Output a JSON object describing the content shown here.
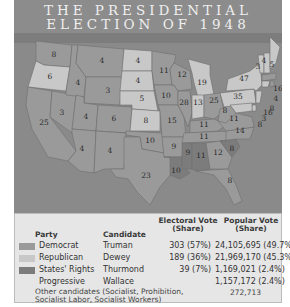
{
  "title": {
    "line1": "THE PRESIDENTIAL",
    "line2": "ELECTION OF 1948"
  },
  "colors": {
    "democrat": "#9a9a9a",
    "republican": "#c8c8c8",
    "states_rights": "#7c7c7c",
    "ocean": "#8a8a8a",
    "legend_bg": "#e6e6e6"
  },
  "map": {
    "states": [
      {
        "abbr": "WA",
        "ev": "8",
        "party": "democrat"
      },
      {
        "abbr": "OR",
        "ev": "6",
        "party": "republican"
      },
      {
        "abbr": "CA",
        "ev": "25",
        "party": "democrat"
      },
      {
        "abbr": "NV",
        "ev": "3",
        "party": "democrat"
      },
      {
        "abbr": "ID",
        "ev": "4",
        "party": "democrat"
      },
      {
        "abbr": "MT",
        "ev": "4",
        "party": "democrat"
      },
      {
        "abbr": "WY",
        "ev": "3",
        "party": "democrat"
      },
      {
        "abbr": "UT",
        "ev": "4",
        "party": "democrat"
      },
      {
        "abbr": "CO",
        "ev": "6",
        "party": "democrat"
      },
      {
        "abbr": "AZ",
        "ev": "4",
        "party": "democrat"
      },
      {
        "abbr": "NM",
        "ev": "4",
        "party": "democrat"
      },
      {
        "abbr": "ND",
        "ev": "4",
        "party": "republican"
      },
      {
        "abbr": "SD",
        "ev": "4",
        "party": "republican"
      },
      {
        "abbr": "NE",
        "ev": "6",
        "party": "republican"
      },
      {
        "abbr": "KS",
        "ev": "8",
        "party": "republican"
      },
      {
        "abbr": "OK",
        "ev": "10",
        "party": "democrat"
      },
      {
        "abbr": "TX",
        "ev": "23",
        "party": "democrat"
      },
      {
        "abbr": "MN",
        "ev": "11",
        "party": "democrat"
      },
      {
        "abbr": "IA",
        "ev": "10",
        "party": "democrat"
      },
      {
        "abbr": "MO",
        "ev": "15",
        "party": "democrat"
      },
      {
        "abbr": "AR",
        "ev": "9",
        "party": "democrat"
      },
      {
        "abbr": "LA",
        "ev": "10",
        "party": "states_rights"
      },
      {
        "abbr": "WI",
        "ev": "12",
        "party": "democrat"
      },
      {
        "abbr": "IL",
        "ev": "28",
        "party": "democrat"
      },
      {
        "abbr": "MI",
        "ev": "19",
        "party": "republican"
      },
      {
        "abbr": "IN",
        "ev": "13",
        "party": "republican"
      },
      {
        "abbr": "OH",
        "ev": "25",
        "party": "democrat"
      },
      {
        "abbr": "KY",
        "ev": "11",
        "party": "democrat"
      },
      {
        "abbr": "TN",
        "ev": "11",
        "party": "democrat"
      },
      {
        "abbr": "MS",
        "ev": "9",
        "party": "states_rights"
      },
      {
        "abbr": "AL",
        "ev": "11",
        "party": "states_rights"
      },
      {
        "abbr": "GA",
        "ev": "12",
        "party": "democrat"
      },
      {
        "abbr": "FL",
        "ev": "8",
        "party": "democrat"
      },
      {
        "abbr": "SC",
        "ev": "8",
        "party": "states_rights"
      },
      {
        "abbr": "NC",
        "ev": "14",
        "party": "democrat"
      },
      {
        "abbr": "VA",
        "ev": "11",
        "party": "democrat"
      },
      {
        "abbr": "WV",
        "ev": "8",
        "party": "democrat"
      },
      {
        "abbr": "PA",
        "ev": "35",
        "party": "republican"
      },
      {
        "abbr": "NY",
        "ev": "47",
        "party": "republican"
      },
      {
        "abbr": "VT",
        "ev": "3",
        "party": "republican"
      },
      {
        "abbr": "NH",
        "ev": "4",
        "party": "republican"
      },
      {
        "abbr": "ME",
        "ev": "5",
        "party": "republican"
      },
      {
        "abbr": "MA",
        "ev": "16",
        "party": "democrat"
      },
      {
        "abbr": "RI",
        "ev": "4",
        "party": "democrat"
      },
      {
        "abbr": "CT",
        "ev": "8",
        "party": "republican"
      },
      {
        "abbr": "NJ",
        "ev": "16",
        "party": "republican"
      },
      {
        "abbr": "DE",
        "ev": "3",
        "party": "republican"
      },
      {
        "abbr": "MD",
        "ev": "8",
        "party": "republican"
      }
    ]
  },
  "legend": {
    "headers": {
      "party": "Party",
      "candidate": "Candidate",
      "electoral_line1": "Electoral Vote",
      "electoral_line2": "(Share)",
      "popular_line1": "Popular Vote",
      "popular_line2": "(Share)"
    },
    "rows": [
      {
        "party": "Democrat",
        "candidate": "Truman",
        "electoral": "303 (57%)",
        "popular": "24,105,695 (49.7%)"
      },
      {
        "party": "Republican",
        "candidate": "Dewey",
        "electoral": "189 (36%)",
        "popular": "21,969,170 (45.3%)"
      },
      {
        "party": "States' Rights",
        "candidate": "Thurmond",
        "electoral": "39 (7%)",
        "popular": "1,169,021 (2.4%)"
      },
      {
        "party": "Progressive",
        "candidate": "Wallace",
        "electoral": "",
        "popular": "1,157,172 (2.4%)"
      }
    ],
    "other": {
      "line1": "Other candidates (Socialist, Prohibition,",
      "line2": "Socialist Labor, Socialist Workers)",
      "popular": "272,713"
    }
  }
}
